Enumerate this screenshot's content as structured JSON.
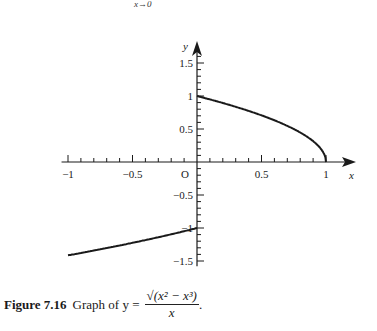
{
  "header": {
    "limit_subscript": "x→0"
  },
  "chart_data": {
    "type": "line",
    "xlabel": "x",
    "ylabel": "y",
    "origin_label": "O",
    "xlim": [
      -1,
      1.2
    ],
    "ylim": [
      -1.5,
      1.7
    ],
    "x_tick_labels": [
      "-1",
      "-0.5",
      "0.5",
      "1"
    ],
    "y_tick_labels": [
      "1.5",
      "1",
      "0.5",
      "-0.5",
      "-1",
      "-1.5"
    ],
    "x_minor_step": 0.1,
    "y_minor_step": 0.1,
    "grid": false,
    "series": [
      {
        "name": "branch x<0",
        "x": [
          -1,
          -0.8,
          -0.6,
          -0.4,
          -0.2,
          0
        ],
        "y": [
          -1.414,
          -1.342,
          -1.265,
          -1.183,
          -1.095,
          -1.0
        ]
      },
      {
        "name": "branch 0<x<=1",
        "x": [
          0,
          0.2,
          0.4,
          0.6,
          0.8,
          0.9,
          0.95,
          1.0
        ],
        "y": [
          1.0,
          0.894,
          0.775,
          0.632,
          0.447,
          0.316,
          0.224,
          0.0
        ]
      }
    ]
  },
  "caption": {
    "figure_label": "Figure 7.16",
    "text": "Graph of y =",
    "numerator": "√(x² − x³)",
    "denominator": "x",
    "period": "."
  }
}
